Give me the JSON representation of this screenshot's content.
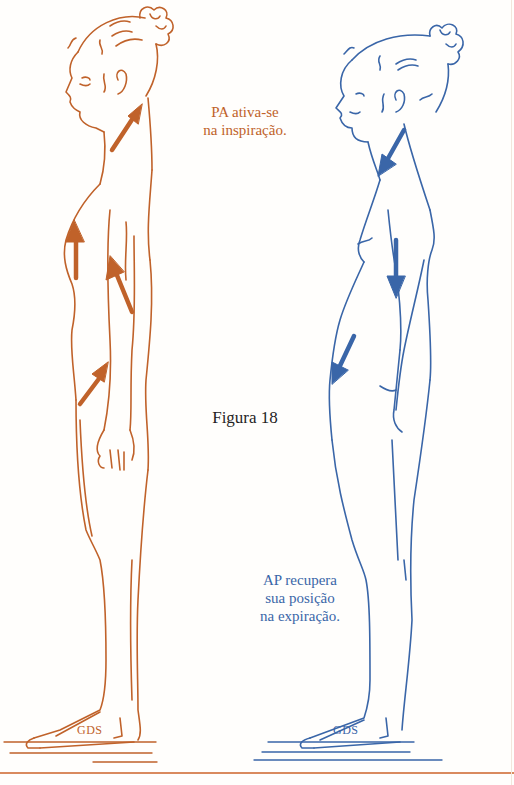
{
  "figure": {
    "label": "Figura 18",
    "colors": {
      "inspiration": "#c0622a",
      "expiration": "#3a66a8",
      "label": "#1f1f1f",
      "background": "#fffefc"
    }
  },
  "left_figure": {
    "name": "inspiration-figure",
    "caption_lines": [
      "PA ativa-se",
      "na inspiração."
    ],
    "floor_mark": "GDS",
    "arrows": [
      {
        "location": "neck",
        "direction": "up"
      },
      {
        "location": "chest",
        "direction": "up"
      },
      {
        "location": "arm",
        "direction": "up"
      },
      {
        "location": "abdomen",
        "direction": "up"
      }
    ]
  },
  "right_figure": {
    "name": "expiration-figure",
    "caption_lines": [
      "AP recupera",
      "sua posição",
      "na expiração."
    ],
    "floor_mark": "GDS",
    "arrows": [
      {
        "location": "neck",
        "direction": "down"
      },
      {
        "location": "back",
        "direction": "down"
      },
      {
        "location": "abdomen",
        "direction": "down"
      }
    ]
  }
}
